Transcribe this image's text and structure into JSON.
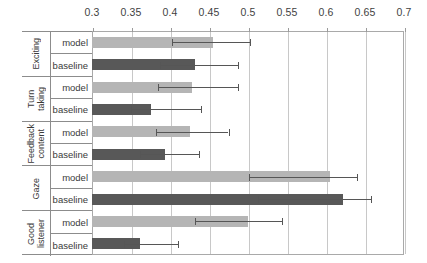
{
  "chart_data": {
    "type": "bar",
    "orientation": "horizontal",
    "title": "",
    "xlabel": "",
    "ylabel": "",
    "xlim": [
      0.3,
      0.7
    ],
    "xticks": [
      0.3,
      0.35,
      0.4,
      0.45,
      0.5,
      0.55,
      0.6,
      0.65,
      0.7
    ],
    "xtick_labels": [
      "0.3",
      "0.35",
      "0.4",
      "0.45",
      "0.5",
      "0.55",
      "0.6",
      "0.65",
      "0.7"
    ],
    "grid": true,
    "legend": "none",
    "categories": [
      "Exciting",
      "Turn taking",
      "Feedback content",
      "Gaze",
      "Good listener"
    ],
    "series": [
      {
        "name": "model",
        "color": "#b5b5b5",
        "values": [
          0.455,
          0.428,
          0.425,
          0.605,
          0.5
        ],
        "errors_high": [
          0.503,
          0.487,
          0.475,
          0.64,
          0.543
        ]
      },
      {
        "name": "baseline",
        "color": "#585858",
        "values": [
          0.432,
          0.375,
          0.394,
          0.622,
          0.362
        ],
        "errors_high": [
          0.487,
          0.44,
          0.437,
          0.658,
          0.41
        ]
      }
    ]
  },
  "axis": {
    "tick_labels": [
      "0.3",
      "0.35",
      "0.4",
      "0.45",
      "0.5",
      "0.55",
      "0.6",
      "0.65",
      "0.7"
    ]
  },
  "rows": [
    {
      "category": "Exciting",
      "model_label": "model",
      "baseline_label": "baseline"
    },
    {
      "category": "Turn\ntaking",
      "model_label": "model",
      "baseline_label": "baseline"
    },
    {
      "category": "Feedback\ncontent",
      "model_label": "model",
      "baseline_label": "baseline"
    },
    {
      "category": "Gaze",
      "model_label": "model",
      "baseline_label": "baseline"
    },
    {
      "category": "Good\nlistener",
      "model_label": "model",
      "baseline_label": "baseline"
    }
  ],
  "colors": {
    "model_bar": "#b5b5b5",
    "baseline_bar": "#585858",
    "gridline": "#c8c8c8",
    "frame": "#a9a9a9",
    "text": "#3a3a3a"
  }
}
